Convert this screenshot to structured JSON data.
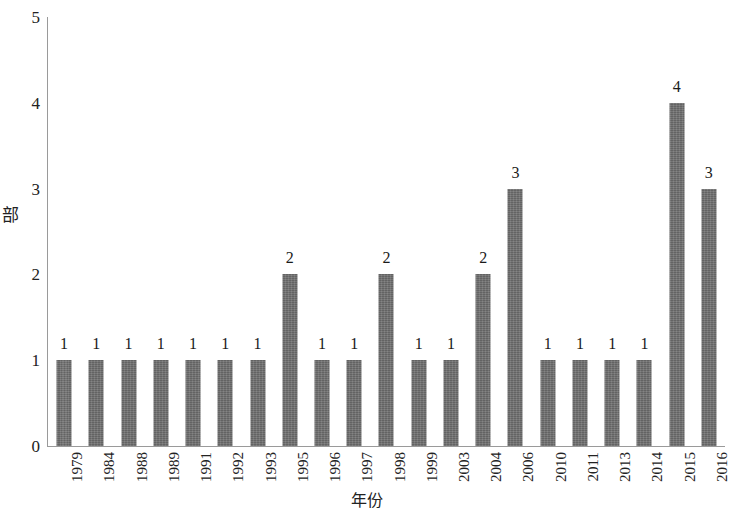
{
  "chart_data": {
    "type": "bar",
    "title": "",
    "subtitle": "",
    "xlabel": "年份",
    "ylabel": "部",
    "categories": [
      "1979",
      "1984",
      "1988",
      "1989",
      "1991",
      "1992",
      "1993",
      "1995",
      "1996",
      "1997",
      "1998",
      "1999",
      "2003",
      "2004",
      "2006",
      "2010",
      "2011",
      "2013",
      "2014",
      "2015",
      "2016"
    ],
    "values": [
      1,
      1,
      1,
      1,
      1,
      1,
      1,
      2,
      1,
      1,
      2,
      1,
      1,
      2,
      3,
      1,
      1,
      1,
      1,
      4,
      3
    ],
    "data_labels": [
      "1",
      "1",
      "1",
      "1",
      "1",
      "1",
      "1",
      "2",
      "1",
      "1",
      "2",
      "1",
      "1",
      "2",
      "3",
      "1",
      "1",
      "1",
      "1",
      "4",
      "3"
    ],
    "ylim": [
      0,
      5
    ],
    "y_ticks": [
      "0",
      "1",
      "2",
      "3",
      "4",
      "5"
    ],
    "grid": false,
    "legend": null,
    "legend_position": "none",
    "bar_color": "#6e6e6e",
    "axis_color": "#9a9a9a",
    "background_color": "#ffffff",
    "annotations": []
  }
}
